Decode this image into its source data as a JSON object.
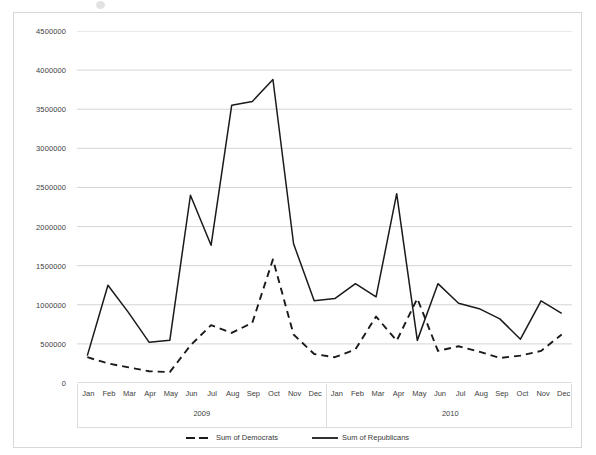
{
  "chart_data": {
    "type": "line",
    "title": "",
    "subtitle": "",
    "xlabel": "",
    "ylabel": "",
    "grid": true,
    "legend_position": "bottom",
    "ylim": [
      0,
      4500000
    ],
    "ytick_labels": [
      "4500000",
      "4000000",
      "3500000",
      "3000000",
      "2500000",
      "2000000",
      "1500000",
      "1000000",
      "500000",
      "0"
    ],
    "yticks": [
      4500000,
      4000000,
      3500000,
      3000000,
      2500000,
      2000000,
      1500000,
      1000000,
      500000,
      0
    ],
    "categories": [
      "Jan",
      "Feb",
      "Mar",
      "Apr",
      "May",
      "Jun",
      "Jul",
      "Aug",
      "Sep",
      "Oct",
      "Nov",
      "Dec",
      "Jan",
      "Feb",
      "Mar",
      "Apr",
      "May",
      "Jun",
      "Jul",
      "Aug",
      "Sep",
      "Oct",
      "Nov",
      "Dec"
    ],
    "x_groups": [
      {
        "label": "2009",
        "months": [
          "Jan",
          "Feb",
          "Mar",
          "Apr",
          "May",
          "Jun",
          "Jul",
          "Aug",
          "Sep",
          "Oct",
          "Nov",
          "Dec"
        ]
      },
      {
        "label": "2010",
        "months": [
          "Jan",
          "Feb",
          "Mar",
          "Apr",
          "May",
          "Jun",
          "Jul",
          "Aug",
          "Sep",
          "Oct",
          "Nov",
          "Dec"
        ]
      }
    ],
    "series": [
      {
        "name": "Sum of Democrats",
        "style": "dashed",
        "color": "#1a1a1a",
        "values": [
          330000,
          250000,
          200000,
          150000,
          140000,
          480000,
          740000,
          640000,
          770000,
          1580000,
          620000,
          370000,
          330000,
          430000,
          850000,
          540000,
          1080000,
          410000,
          470000,
          400000,
          320000,
          350000,
          410000,
          620000
        ]
      },
      {
        "name": "Sum of Republicans",
        "style": "solid",
        "color": "#1a1a1a",
        "values": [
          350000,
          1250000,
          900000,
          520000,
          545000,
          2400000,
          1760000,
          3550000,
          3600000,
          3880000,
          1780000,
          1050000,
          1080000,
          1270000,
          1100000,
          2420000,
          545000,
          1270000,
          1020000,
          950000,
          820000,
          560000,
          1050000,
          890000
        ]
      }
    ]
  },
  "legend": {
    "items": [
      {
        "label": "Sum of Democrats",
        "style": "dashed"
      },
      {
        "label": "Sum of Republicans",
        "style": "solid"
      }
    ]
  }
}
